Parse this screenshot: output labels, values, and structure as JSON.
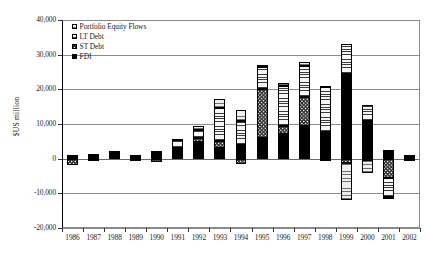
{
  "chart_data": {
    "type": "bar",
    "subtype": "stacked-bar-with-negatives",
    "title": "",
    "xlabel": "",
    "ylabel": "$US million",
    "ylim": [
      -20000,
      40000
    ],
    "ytick_step": 10000,
    "ytick_labels": [
      "40,000",
      "30,000",
      "20,000",
      "10,000",
      "0",
      "-10,000",
      "-20,000"
    ],
    "ytick_values": [
      40000,
      30000,
      20000,
      10000,
      0,
      -10000,
      -20000
    ],
    "grid": true,
    "legend_position": "top-left-inside",
    "categories": [
      "1986",
      "1987",
      "1988",
      "1989",
      "1990",
      "1991",
      "1992",
      "1993",
      "1994",
      "1995",
      "1996",
      "1997",
      "1998",
      "1999",
      "2000",
      "2001",
      "2002"
    ],
    "series": [
      {
        "name": "FDI",
        "pattern": "solid-black",
        "values": [
          500,
          400,
          1500,
          500,
          1800,
          2800,
          4800,
          3200,
          4000,
          6100,
          7200,
          9500,
          7800,
          24500,
          11000,
          2500,
          700
        ]
      },
      {
        "name": "ST Debt",
        "pattern": "checkerboard",
        "values": [
          -1800,
          -600,
          100,
          -600,
          -1100,
          300,
          1100,
          2000,
          -1400,
          14000,
          2100,
          8400,
          -800,
          -1200,
          -300,
          -5500,
          -200
        ]
      },
      {
        "name": "LT Debt",
        "pattern": "horizontal-lines",
        "values": [
          400,
          700,
          400,
          400,
          200,
          2300,
          2300,
          9500,
          7000,
          6200,
          11800,
          8800,
          13000,
          8500,
          4400,
          -5500,
          200
        ]
      },
      {
        "name": "Portfolio Equity Flows",
        "pattern": "fine-horizontal-dots",
        "values": [
          100,
          300,
          100,
          100,
          100,
          200,
          1200,
          2500,
          3100,
          700,
          800,
          1300,
          300,
          -10600,
          -3700,
          -300,
          100
        ]
      }
    ],
    "totals_note": "Stacked positive segments above zero; negative segments stacked below zero."
  },
  "legend": {
    "items": [
      {
        "label": "Portfolio Equity Flows",
        "swatch": "fine-horizontal-dots-swatch"
      },
      {
        "label": "LT Debt",
        "swatch": "horizontal-lines-swatch"
      },
      {
        "label": "ST Debt",
        "swatch": "checkerboard-swatch"
      },
      {
        "label": "FDI",
        "swatch": "solid-black-swatch"
      }
    ]
  },
  "axes": {
    "y_title": "$US million",
    "y_ticks": [
      "40,000",
      "30,000",
      "20,000",
      "10,000",
      "0",
      "-10,000",
      "-20,000"
    ],
    "x_ticks": [
      "1986",
      "1987",
      "1988",
      "1989",
      "1990",
      "1991",
      "1992",
      "1993",
      "1994",
      "1995",
      "1996",
      "1997",
      "1998",
      "1999",
      "2000",
      "2001",
      "2002"
    ]
  },
  "caption": {
    "text": ""
  }
}
